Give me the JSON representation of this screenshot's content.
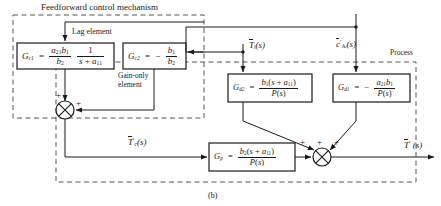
{
  "figure": {
    "caption": "(b)",
    "regions": [
      {
        "name": "feedforward-control-mechanism",
        "label": "Feedforward control mechanism"
      },
      {
        "name": "process",
        "label": "Process"
      }
    ]
  },
  "annotations": {
    "lag_element": "Lag element",
    "gain_only_element_line1": "Gain-only",
    "gain_only_element_line2": "element"
  },
  "blocks": [
    {
      "id": "Gc1",
      "name": "block-gc1",
      "symbol": "G",
      "subscript": "c1",
      "equals": "=",
      "expr_type": "product-of-fractions",
      "frac1": {
        "num": "a21 b1",
        "den": "b2"
      },
      "frac2": {
        "num": "1",
        "den": "s + a11"
      }
    },
    {
      "id": "Gc2",
      "name": "block-gc2",
      "symbol": "G",
      "subscript": "c2",
      "equals": "=",
      "sign": "−",
      "expr_type": "fraction",
      "frac": {
        "num": "b1",
        "den": "b2"
      }
    },
    {
      "id": "Gd2",
      "name": "block-gd2",
      "symbol": "G",
      "subscript": "d2",
      "equals": "=",
      "expr_type": "fraction",
      "frac": {
        "num": "b1(s + a11)",
        "den": "P(s)"
      }
    },
    {
      "id": "Gd1",
      "name": "block-gd1",
      "symbol": "G",
      "subscript": "d1",
      "equals": "=",
      "sign": "−",
      "expr_type": "fraction",
      "frac": {
        "num": "a21 b1",
        "den": "P(s)"
      }
    },
    {
      "id": "Gp",
      "name": "block-gp",
      "symbol": "G",
      "subscript": "p",
      "equals": "=",
      "expr_type": "fraction",
      "frac": {
        "num": "b2(s + a11)",
        "den": "P(s)"
      }
    }
  ],
  "signals": {
    "disturbance_temperature": "Ti(s)",
    "disturbance_concentration": "cAi(s)",
    "controller_output": "Tc(s)",
    "process_output": "T(s)"
  },
  "summers": [
    {
      "name": "summing-junction-controller",
      "signs": [
        "+",
        "+"
      ]
    },
    {
      "name": "summing-junction-process",
      "signs": [
        "+",
        "+",
        "+"
      ]
    }
  ],
  "colors": {
    "line": "#1a1a1a",
    "dashed": "#555555",
    "background": "#ffffff"
  }
}
